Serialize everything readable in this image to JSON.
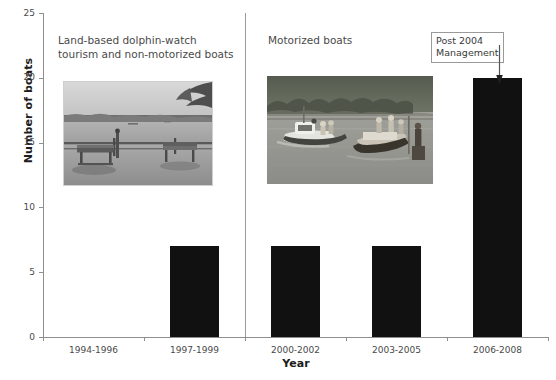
{
  "chart_data": {
    "type": "bar",
    "title": "",
    "categories": [
      "1994-1996",
      "1997-1999",
      "2000-2002",
      "2003-2005",
      "2006-2008"
    ],
    "values": [
      0,
      7,
      7,
      7,
      20
    ],
    "xlabel": "Year",
    "ylabel": "Number of boats",
    "ylim": [
      0,
      25
    ],
    "ytick_labels": [
      "0",
      "5",
      "10",
      "15",
      "20",
      "25"
    ],
    "ytick_values": [
      0,
      5,
      10,
      15,
      20,
      25
    ],
    "grid": false,
    "legend": false,
    "bar_color": "#111111",
    "axis_color": "#8e8e8e",
    "annotations": [
      {
        "name": "left-section-caption",
        "text": "Land-based dolphin-watch\ntourism and non-motorized boats"
      },
      {
        "name": "right-section-caption",
        "text": "Motorized boats"
      },
      {
        "name": "post-2004-management-callout",
        "text": "Post 2004\nManagement",
        "points_to_category": "2006-2008"
      }
    ],
    "divider": {
      "between_categories": [
        "1997-1999",
        "2000-2002"
      ],
      "color": "#9a9a9a"
    },
    "images": [
      {
        "name": "land-based-tourism-photo",
        "alt": "Grayscale photo of two park benches on a shore facing a wide bay with distant trees"
      },
      {
        "name": "motorized-boats-photo",
        "alt": "Photo of motorized tour boats with passengers on a river with forested bank"
      }
    ]
  }
}
